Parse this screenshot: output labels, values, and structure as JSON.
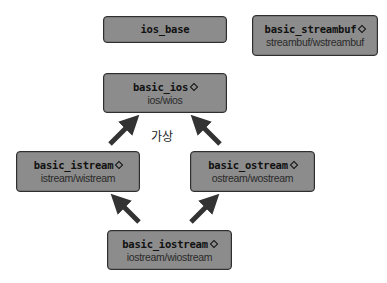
{
  "diagram": {
    "type": "class-hierarchy",
    "nodes": {
      "ios_base": {
        "name": "ios_base",
        "subtitle": ""
      },
      "basic_streambuf": {
        "name": "basic_streambuf",
        "template_marker": "diamond",
        "subtitle": "streambuf/wstreambuf"
      },
      "basic_ios": {
        "name": "basic_ios",
        "template_marker": "diamond",
        "subtitle": "ios/wios"
      },
      "basic_istream": {
        "name": "basic_istream",
        "template_marker": "diamond",
        "subtitle": "istream/wistream"
      },
      "basic_ostream": {
        "name": "basic_ostream",
        "template_marker": "diamond",
        "subtitle": "ostream/wostream"
      },
      "basic_iostream": {
        "name": "basic_iostream",
        "template_marker": "diamond",
        "subtitle": "iostream/wiostream"
      }
    },
    "edges": [
      {
        "from": "basic_istream",
        "to": "basic_ios"
      },
      {
        "from": "basic_ostream",
        "to": "basic_ios"
      },
      {
        "from": "basic_iostream",
        "to": "basic_istream"
      },
      {
        "from": "basic_iostream",
        "to": "basic_ostream"
      }
    ],
    "virtual_label": "가상",
    "colors": {
      "box_fill": "#8c8c8c",
      "box_border": "#2e2e2e",
      "arrow": "#333333",
      "background": "#ffffff"
    }
  }
}
